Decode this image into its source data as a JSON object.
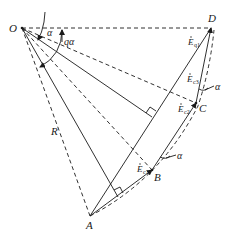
{
  "diagram": {
    "points": {
      "O": {
        "label": "O",
        "x": 22,
        "y": 28
      },
      "D": {
        "label": "D",
        "x": 211,
        "y": 28
      },
      "C": {
        "label": "C",
        "x": 196,
        "y": 103
      },
      "B": {
        "label": "B",
        "x": 152,
        "y": 170
      },
      "A": {
        "label": "A",
        "x": 90,
        "y": 216
      }
    },
    "labels": {
      "O": "O",
      "D": "D",
      "C": "C",
      "B": "B",
      "A": "A",
      "R": "R",
      "alpha_top": "α",
      "q_alpha": "qα",
      "alpha_C": "α",
      "alpha_B": "α",
      "Eq1_main": "E",
      "Eq1_sub": "q1",
      "Ec3_main": "E",
      "Ec3_sub": "c3",
      "Ec2_main": "E",
      "Ec2_sub": "c2",
      "Ec1_main": "E",
      "Ec1_sub": "c1"
    },
    "colors": {
      "line": "#1a1a1a",
      "background": "#ffffff"
    }
  }
}
